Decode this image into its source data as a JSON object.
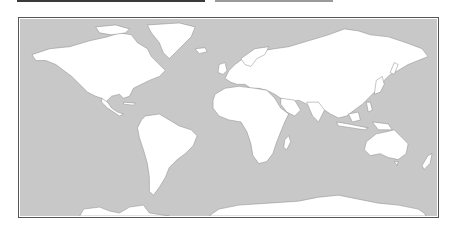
{
  "map": {
    "title": "",
    "projection": "mercator",
    "colors": {
      "ocean": "#c8c8c8",
      "land": "#ffffff",
      "coast": "#8a8a8a",
      "frame": "#555555"
    },
    "regions": [
      "North America",
      "Greenland",
      "South America",
      "Europe",
      "Africa",
      "Asia",
      "Australia",
      "New Zealand",
      "Antarctica",
      "Indonesia",
      "Japan",
      "Madagascar",
      "British Isles",
      "Iceland"
    ]
  }
}
